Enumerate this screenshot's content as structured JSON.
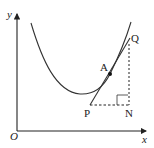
{
  "diagram": {
    "type": "tangent-to-curve",
    "axes": {
      "x_label": "x",
      "y_label": "y",
      "origin_label": "O"
    },
    "points": {
      "A": "A",
      "P": "P",
      "Q": "Q",
      "N": "N"
    },
    "annotations": {
      "right_angle_at": "N",
      "dashed_segments": [
        "PN",
        "NQ"
      ],
      "tangent_line": "PQ through A"
    },
    "colors": {
      "stroke": "#222222",
      "background": "#ffffff"
    }
  }
}
